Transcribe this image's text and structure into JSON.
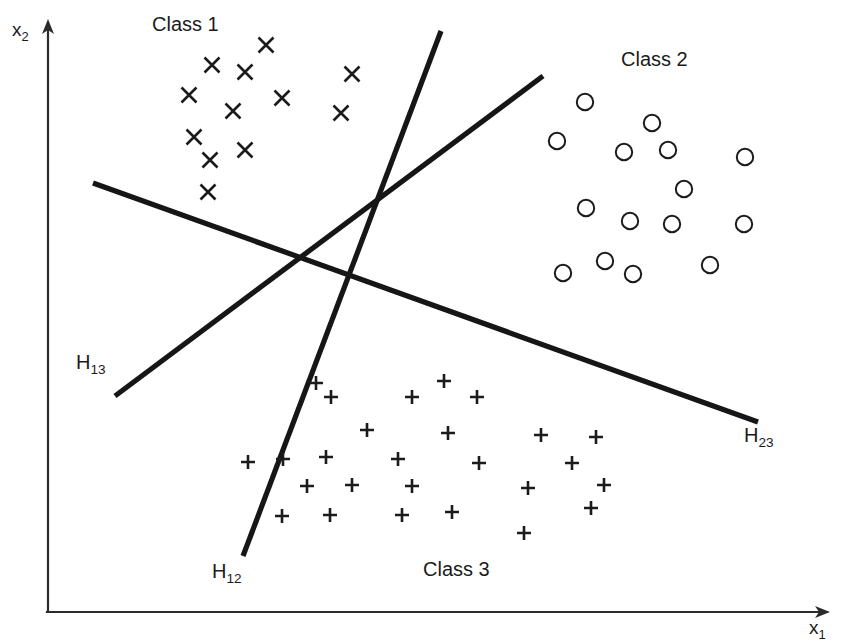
{
  "figure": {
    "title": "",
    "background_color": "#ffffff",
    "ink_color": "#1b1b1b"
  },
  "axes": {
    "x_axis": {
      "label_base": "x",
      "label_sub": "1",
      "label_full": "x1"
    },
    "y_axis": {
      "label_base": "x",
      "label_sub": "2",
      "label_full": "x2"
    }
  },
  "class_labels": {
    "class1": "Class 1",
    "class2": "Class 2",
    "class3": "Class 3"
  },
  "boundary_labels": {
    "h13": {
      "base": "H",
      "sub": "13",
      "full": "H13"
    },
    "h12": {
      "base": "H",
      "sub": "12",
      "full": "H12"
    },
    "h23": {
      "base": "H",
      "sub": "23",
      "full": "H23"
    }
  },
  "chart_data": {
    "type": "scatter",
    "title": "",
    "xlabel": "x1",
    "ylabel": "x2",
    "xlim": [
      0,
      845
    ],
    "ylim": [
      0,
      644
    ],
    "grid": false,
    "legend": "inline-annotations",
    "note": "Three linearly separable classes with three pairwise linear decision boundaries H12, H13, H23 meeting near the centre of the plot.",
    "series": [
      {
        "name": "Class 1",
        "marker": "x",
        "label_position": {
          "x": 152,
          "y": 14
        },
        "points": [
          [
            266,
            45
          ],
          [
            212,
            65
          ],
          [
            245,
            72
          ],
          [
            352,
            74
          ],
          [
            189,
            95
          ],
          [
            233,
            111
          ],
          [
            282,
            98
          ],
          [
            341,
            113
          ],
          [
            194,
            137
          ],
          [
            245,
            150
          ],
          [
            210,
            160
          ],
          [
            208,
            192
          ]
        ]
      },
      {
        "name": "Class 2",
        "marker": "o",
        "label_position": {
          "x": 621,
          "y": 49
        },
        "points": [
          [
            585,
            102
          ],
          [
            652,
            123
          ],
          [
            557,
            141
          ],
          [
            624,
            152
          ],
          [
            668,
            150
          ],
          [
            745,
            157
          ],
          [
            684,
            189
          ],
          [
            586,
            208
          ],
          [
            630,
            221
          ],
          [
            672,
            224
          ],
          [
            744,
            224
          ],
          [
            563,
            273
          ],
          [
            605,
            261
          ],
          [
            633,
            274
          ],
          [
            710,
            265
          ]
        ]
      },
      {
        "name": "Class 3",
        "marker": "+",
        "label_position": {
          "x": 423,
          "y": 559
        },
        "points": [
          [
            316,
            383
          ],
          [
            444,
            381
          ],
          [
            331,
            397
          ],
          [
            412,
            397
          ],
          [
            477,
            397
          ],
          [
            367,
            430
          ],
          [
            448,
            433
          ],
          [
            541,
            435
          ],
          [
            596,
            437
          ],
          [
            248,
            462
          ],
          [
            283,
            459
          ],
          [
            326,
            457
          ],
          [
            398,
            459
          ],
          [
            479,
            463
          ],
          [
            572,
            463
          ],
          [
            307,
            486
          ],
          [
            352,
            485
          ],
          [
            412,
            486
          ],
          [
            528,
            488
          ],
          [
            604,
            485
          ],
          [
            282,
            516
          ],
          [
            330,
            515
          ],
          [
            402,
            515
          ],
          [
            452,
            512
          ],
          [
            591,
            508
          ],
          [
            524,
            533
          ]
        ]
      }
    ],
    "decision_boundaries": [
      {
        "name": "H13",
        "x1": 93,
        "y1": 183,
        "x2": 758,
        "y2": 422,
        "label_position": {
          "x": 76,
          "y": 352
        }
      },
      {
        "name": "H12",
        "x1": 441,
        "y1": 31,
        "x2": 243,
        "y2": 556,
        "label_position": {
          "x": 212,
          "y": 561
        }
      },
      {
        "name": "H23",
        "x1": 115,
        "y1": 396,
        "x2": 543,
        "y2": 76,
        "label_position": {
          "x": 744,
          "y": 425
        }
      }
    ]
  }
}
